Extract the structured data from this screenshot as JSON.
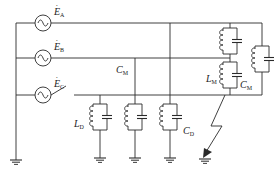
{
  "diagram": {
    "type": "circuit-schematic",
    "stroke_color": "#2a2a2a",
    "background": "#ffffff",
    "sources": [
      {
        "id": "A",
        "label": "E",
        "subscript": "A",
        "hat": "·"
      },
      {
        "id": "B",
        "label": "E",
        "subscript": "B",
        "hat": "·"
      },
      {
        "id": "C",
        "label": "E",
        "subscript": "C",
        "hat": "·"
      }
    ],
    "labels": {
      "cm_bus": {
        "main": "C",
        "sub": "M"
      },
      "lm": {
        "main": "L",
        "sub": "M"
      },
      "cm_tank": {
        "main": "C",
        "sub": "M"
      },
      "ld": {
        "main": "L",
        "sub": "D"
      },
      "cd": {
        "main": "C",
        "sub": "D"
      }
    },
    "components": {
      "phase_to_ground_tanks": 3,
      "phase_to_phase_tanks": 3,
      "grounds": 5,
      "fault": "ground-fault-arrow",
      "switch": "open-switch-phase-C"
    }
  }
}
